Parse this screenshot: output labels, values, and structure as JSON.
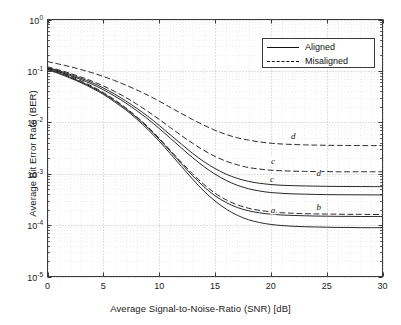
{
  "chart_data": {
    "type": "line",
    "title": "",
    "xlabel": "Average Signal-to-Noise-Ratio (SNR) [dB]",
    "ylabel": "Average Bit Error Rate (BER)",
    "xscale": "linear",
    "yscale": "log",
    "xlim": [
      0,
      30
    ],
    "ylim": [
      1e-05,
      1
    ],
    "xticks": [
      "0",
      "5",
      "10",
      "15",
      "20",
      "25",
      "30"
    ],
    "xtick_values": [
      0,
      5,
      10,
      15,
      20,
      25,
      30
    ],
    "yticks": [
      {
        "mantissa": "10",
        "exponent": "0",
        "value": 1
      },
      {
        "mantissa": "10",
        "exponent": "-1",
        "value": 0.1
      },
      {
        "mantissa": "10",
        "exponent": "-2",
        "value": 0.01
      },
      {
        "mantissa": "10",
        "exponent": "-3",
        "value": 0.001
      },
      {
        "mantissa": "10",
        "exponent": "-4",
        "value": 0.0001
      },
      {
        "mantissa": "10",
        "exponent": "-5",
        "value": 1e-05
      }
    ],
    "grid": "dotted-major-and-minor",
    "legend_position": "upper right",
    "legend": [
      {
        "label": "Aligned",
        "style": "solid"
      },
      {
        "label": "Misaligned",
        "style": "dashed"
      }
    ],
    "x": [
      0,
      1,
      2,
      3,
      4,
      5,
      6,
      7,
      8,
      9,
      10,
      11,
      12,
      13,
      14,
      15,
      16,
      17,
      18,
      19,
      20,
      21,
      22,
      23,
      24,
      25,
      26,
      27,
      28,
      29,
      30
    ],
    "series": [
      {
        "name": "a",
        "label": "a",
        "style": "solid",
        "group": "Aligned",
        "label_x": 20.2,
        "label_y": 0.000195,
        "values": [
          0.105,
          0.089,
          0.073,
          0.059,
          0.046,
          0.035,
          0.025,
          0.0175,
          0.0115,
          0.0072,
          0.0043,
          0.00245,
          0.00138,
          0.00078,
          0.00046,
          0.000295,
          0.000205,
          0.000155,
          0.000127,
          0.000112,
          0.000103,
          9.8e-05,
          9.5e-05,
          9.3e-05,
          9.2e-05,
          9.1e-05,
          9e-05,
          9e-05,
          8.9e-05,
          8.9e-05,
          8.9e-05
        ]
      },
      {
        "name": "b-solid",
        "label": "b",
        "style": "solid",
        "group": "Aligned",
        "label_x": 24.3,
        "label_y": 0.00023,
        "values": [
          0.108,
          0.092,
          0.076,
          0.061,
          0.048,
          0.0365,
          0.0265,
          0.0185,
          0.0123,
          0.0078,
          0.0047,
          0.00272,
          0.00156,
          0.00091,
          0.00056,
          0.000372,
          0.000275,
          0.00022,
          0.00019,
          0.000173,
          0.000163,
          0.000157,
          0.000154,
          0.000152,
          0.00015,
          0.000149,
          0.000148,
          0.000148,
          0.000147,
          0.000147,
          0.000147
        ]
      },
      {
        "name": "b-dashed",
        "label": "",
        "style": "dashed",
        "group": "Misaligned",
        "values": [
          0.112,
          0.096,
          0.079,
          0.064,
          0.05,
          0.038,
          0.0275,
          0.0192,
          0.0128,
          0.0081,
          0.0049,
          0.00285,
          0.00166,
          0.00099,
          0.00062,
          0.000418,
          0.00031,
          0.000248,
          0.000213,
          0.000193,
          0.000182,
          0.000174,
          0.00017,
          0.000167,
          0.000165,
          0.000164,
          0.000163,
          0.000162,
          0.000162,
          0.000161,
          0.000161
        ]
      },
      {
        "name": "c-solid",
        "label": "c",
        "style": "solid",
        "group": "Aligned",
        "label_x": 20.1,
        "label_y": 0.0008,
        "values": [
          0.112,
          0.097,
          0.082,
          0.068,
          0.055,
          0.043,
          0.0325,
          0.0238,
          0.0168,
          0.0115,
          0.0076,
          0.0049,
          0.00315,
          0.00205,
          0.00138,
          0.00098,
          0.00074,
          0.000595,
          0.00051,
          0.00046,
          0.00043,
          0.000415,
          0.000405,
          0.0004,
          0.000395,
          0.000392,
          0.00039,
          0.000389,
          0.000388,
          0.000387,
          0.000386
        ]
      },
      {
        "name": "d-solid",
        "label": "d",
        "style": "solid",
        "group": "Aligned",
        "label_x": 24.3,
        "label_y": 0.00105,
        "values": [
          0.116,
          0.101,
          0.086,
          0.072,
          0.059,
          0.0465,
          0.0355,
          0.0262,
          0.0187,
          0.013,
          0.0087,
          0.0057,
          0.00375,
          0.00248,
          0.00172,
          0.00126,
          0.00098,
          0.00081,
          0.00071,
          0.00065,
          0.000615,
          0.000595,
          0.000585,
          0.000578,
          0.000572,
          0.000568,
          0.000565,
          0.000563,
          0.000562,
          0.000561,
          0.00056
        ]
      },
      {
        "name": "c-dashed",
        "label": "c",
        "style": "dashed",
        "group": "Misaligned",
        "label_x": 20.2,
        "label_y": 0.00175,
        "values": [
          0.12,
          0.105,
          0.09,
          0.076,
          0.063,
          0.051,
          0.04,
          0.0305,
          0.0225,
          0.0162,
          0.0114,
          0.0079,
          0.0055,
          0.0039,
          0.00285,
          0.00217,
          0.00175,
          0.00149,
          0.00132,
          0.00123,
          0.00117,
          0.00114,
          0.00112,
          0.00111,
          0.0011,
          0.0011,
          0.00109,
          0.00109,
          0.00109,
          0.00109,
          0.00109
        ]
      },
      {
        "name": "d-dashed",
        "label": "d",
        "style": "dashed",
        "group": "Misaligned",
        "label_x": 22.0,
        "label_y": 0.0053,
        "values": [
          0.152,
          0.136,
          0.121,
          0.106,
          0.092,
          0.078,
          0.065,
          0.053,
          0.0425,
          0.0335,
          0.0258,
          0.0195,
          0.0148,
          0.0113,
          0.0088,
          0.007,
          0.0058,
          0.005,
          0.0045,
          0.00415,
          0.00392,
          0.00378,
          0.0037,
          0.00364,
          0.0036,
          0.00357,
          0.00355,
          0.00354,
          0.00353,
          0.00352,
          0.00352
        ]
      }
    ],
    "colors": {
      "line": "#111111",
      "axis": "#3a3a3a",
      "grid": "#9a9a9a",
      "background": "#ffffff"
    }
  }
}
